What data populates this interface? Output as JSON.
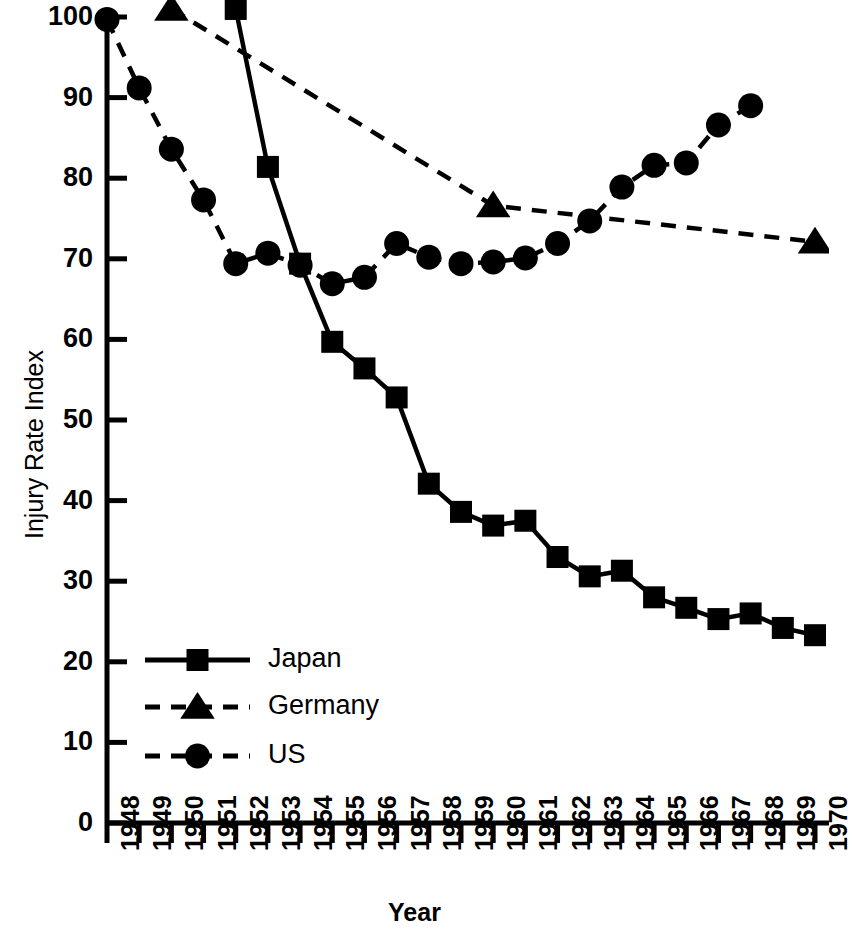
{
  "chart_data": {
    "type": "line",
    "title": "",
    "xlabel": "Year",
    "ylabel": "Injury Rate Index",
    "xlim": [
      1948,
      1970
    ],
    "ylim": [
      0,
      100
    ],
    "ytick_labels": [
      "0",
      "10",
      "20",
      "30",
      "40",
      "50",
      "60",
      "70",
      "80",
      "90",
      "100"
    ],
    "yticks": [
      0,
      10,
      20,
      30,
      40,
      50,
      60,
      70,
      80,
      90,
      100
    ],
    "xtick_labels": [
      "1948",
      "1949",
      "1950",
      "1951",
      "1952",
      "1953",
      "1954",
      "1955",
      "1956",
      "1957",
      "1958",
      "1959",
      "1960",
      "1961",
      "1962",
      "1963",
      "1964",
      "1965",
      "1966",
      "1967",
      "1968",
      "1969",
      "1970"
    ],
    "x": [
      1948,
      1949,
      1950,
      1951,
      1952,
      1953,
      1954,
      1955,
      1956,
      1957,
      1958,
      1959,
      1960,
      1961,
      1962,
      1963,
      1964,
      1965,
      1966,
      1967,
      1968,
      1969,
      1970
    ],
    "grid": false,
    "legend_position": "lower-left",
    "series": [
      {
        "name": "Japan",
        "marker": "square",
        "linestyle": "solid",
        "color": "#000000",
        "points": [
          {
            "x": 1952,
            "y": 101.0
          },
          {
            "x": 1953,
            "y": 81.4
          },
          {
            "x": 1954,
            "y": 69.4
          },
          {
            "x": 1955,
            "y": 59.7
          },
          {
            "x": 1956,
            "y": 56.4
          },
          {
            "x": 1957,
            "y": 52.8
          },
          {
            "x": 1958,
            "y": 42.1
          },
          {
            "x": 1959,
            "y": 38.6
          },
          {
            "x": 1960,
            "y": 36.9
          },
          {
            "x": 1961,
            "y": 37.5
          },
          {
            "x": 1962,
            "y": 33.0
          },
          {
            "x": 1963,
            "y": 30.6
          },
          {
            "x": 1964,
            "y": 31.3
          },
          {
            "x": 1965,
            "y": 28.0
          },
          {
            "x": 1966,
            "y": 26.7
          },
          {
            "x": 1967,
            "y": 25.3
          },
          {
            "x": 1968,
            "y": 26.0
          },
          {
            "x": 1969,
            "y": 24.2
          },
          {
            "x": 1970,
            "y": 23.3
          }
        ]
      },
      {
        "name": "Germany",
        "marker": "triangle",
        "linestyle": "dashed",
        "color": "#000000",
        "points": [
          {
            "x": 1950,
            "y": 101.0
          },
          {
            "x": 1960,
            "y": 76.6
          },
          {
            "x": 1970,
            "y": 72.1
          }
        ]
      },
      {
        "name": "US",
        "marker": "circle",
        "linestyle": "dashed",
        "color": "#000000",
        "points": [
          {
            "x": 1948,
            "y": 99.7
          },
          {
            "x": 1949,
            "y": 91.2
          },
          {
            "x": 1950,
            "y": 83.6
          },
          {
            "x": 1951,
            "y": 77.3
          },
          {
            "x": 1952,
            "y": 69.4
          },
          {
            "x": 1953,
            "y": 70.7
          },
          {
            "x": 1954,
            "y": 69.2
          },
          {
            "x": 1955,
            "y": 66.9
          },
          {
            "x": 1956,
            "y": 67.7
          },
          {
            "x": 1957,
            "y": 71.9
          },
          {
            "x": 1958,
            "y": 70.2
          },
          {
            "x": 1959,
            "y": 69.4
          },
          {
            "x": 1960,
            "y": 69.6
          },
          {
            "x": 1961,
            "y": 70.1
          },
          {
            "x": 1962,
            "y": 71.9
          },
          {
            "x": 1963,
            "y": 74.7
          },
          {
            "x": 1964,
            "y": 78.9
          },
          {
            "x": 1965,
            "y": 81.6
          },
          {
            "x": 1966,
            "y": 81.9
          },
          {
            "x": 1967,
            "y": 86.6
          },
          {
            "x": 1968,
            "y": 89.0
          }
        ]
      }
    ],
    "legend": [
      {
        "label": "Japan",
        "marker": "square",
        "linestyle": "solid"
      },
      {
        "label": "Germany",
        "marker": "triangle",
        "linestyle": "dashed"
      },
      {
        "label": "US",
        "marker": "circle",
        "linestyle": "dashed"
      }
    ]
  }
}
